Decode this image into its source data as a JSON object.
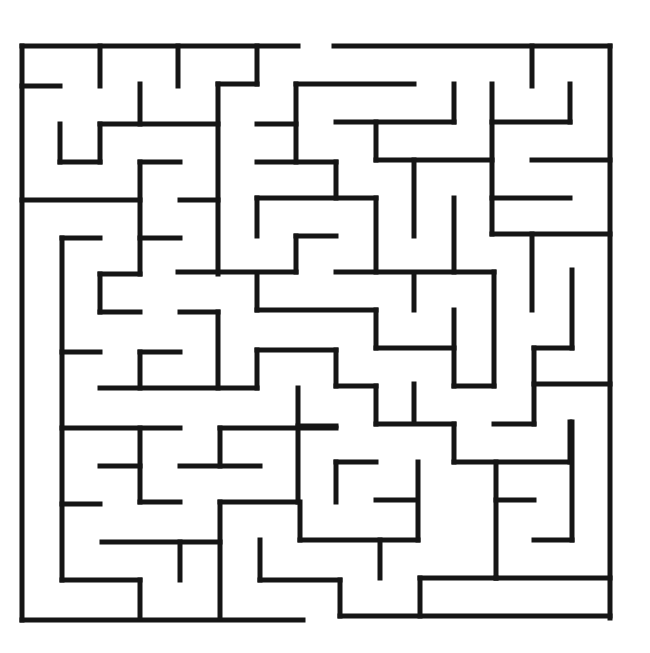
{
  "puzzle": {
    "type": "maze",
    "caption_fragment": "",
    "wall_color": "#151515",
    "background": "#ffffff",
    "entrance": {
      "side": "top",
      "x_range": [
        298,
        334
      ],
      "y": 46
    },
    "exit": {
      "side": "bottom",
      "x_range": [
        303,
        340
      ],
      "y": 618
    },
    "walls": [
      [
        22,
        46,
        298,
        46
      ],
      [
        334,
        46,
        610,
        46
      ],
      [
        610,
        46,
        610,
        618
      ],
      [
        22,
        46,
        22,
        620
      ],
      [
        22,
        620,
        303,
        620
      ],
      [
        340,
        616,
        610,
        616
      ],
      [
        22,
        86,
        60,
        86
      ],
      [
        100,
        46,
        100,
        86
      ],
      [
        178,
        46,
        178,
        86
      ],
      [
        257,
        46,
        257,
        84
      ],
      [
        218,
        84,
        257,
        84
      ],
      [
        218,
        84,
        218,
        274
      ],
      [
        140,
        84,
        140,
        124
      ],
      [
        100,
        124,
        218,
        124
      ],
      [
        100,
        124,
        100,
        162
      ],
      [
        60,
        124,
        60,
        162
      ],
      [
        60,
        162,
        100,
        162
      ],
      [
        140,
        162,
        180,
        162
      ],
      [
        140,
        162,
        140,
        274
      ],
      [
        22,
        200,
        140,
        200
      ],
      [
        180,
        200,
        218,
        200
      ],
      [
        296,
        84,
        414,
        84
      ],
      [
        296,
        84,
        296,
        162
      ],
      [
        257,
        124,
        296,
        124
      ],
      [
        257,
        162,
        336,
        162
      ],
      [
        336,
        162,
        336,
        198
      ],
      [
        336,
        122,
        454,
        122
      ],
      [
        454,
        84,
        454,
        122
      ],
      [
        376,
        122,
        376,
        160
      ],
      [
        376,
        160,
        492,
        160
      ],
      [
        492,
        84,
        492,
        234
      ],
      [
        532,
        46,
        532,
        86
      ],
      [
        570,
        84,
        570,
        122
      ],
      [
        492,
        122,
        570,
        122
      ],
      [
        532,
        160,
        610,
        160
      ],
      [
        492,
        198,
        570,
        198
      ],
      [
        492,
        234,
        610,
        234
      ],
      [
        257,
        198,
        376,
        198
      ],
      [
        257,
        198,
        257,
        236
      ],
      [
        376,
        198,
        376,
        272
      ],
      [
        414,
        160,
        414,
        236
      ],
      [
        454,
        198,
        454,
        272
      ],
      [
        62,
        238,
        100,
        238
      ],
      [
        62,
        238,
        62,
        580
      ],
      [
        140,
        238,
        180,
        238
      ],
      [
        296,
        236,
        336,
        236
      ],
      [
        296,
        236,
        296,
        272
      ],
      [
        178,
        272,
        296,
        272
      ],
      [
        336,
        272,
        494,
        272
      ],
      [
        494,
        272,
        494,
        386
      ],
      [
        532,
        234,
        532,
        310
      ],
      [
        572,
        270,
        572,
        348
      ],
      [
        100,
        274,
        140,
        274
      ],
      [
        100,
        274,
        100,
        312
      ],
      [
        100,
        312,
        140,
        312
      ],
      [
        180,
        312,
        218,
        312
      ],
      [
        218,
        312,
        218,
        388
      ],
      [
        257,
        274,
        257,
        310
      ],
      [
        257,
        310,
        376,
        310
      ],
      [
        376,
        310,
        376,
        348
      ],
      [
        376,
        348,
        454,
        348
      ],
      [
        454,
        310,
        454,
        386
      ],
      [
        454,
        386,
        494,
        386
      ],
      [
        414,
        274,
        414,
        310
      ],
      [
        534,
        348,
        572,
        348
      ],
      [
        534,
        348,
        534,
        424
      ],
      [
        534,
        384,
        610,
        384
      ],
      [
        494,
        424,
        534,
        424
      ],
      [
        62,
        352,
        100,
        352
      ],
      [
        140,
        352,
        180,
        352
      ],
      [
        140,
        352,
        140,
        388
      ],
      [
        100,
        388,
        257,
        388
      ],
      [
        257,
        350,
        257,
        388
      ],
      [
        257,
        350,
        336,
        350
      ],
      [
        336,
        350,
        336,
        386
      ],
      [
        336,
        386,
        376,
        386
      ],
      [
        376,
        386,
        376,
        424
      ],
      [
        298,
        388,
        298,
        502
      ],
      [
        414,
        384,
        414,
        422
      ],
      [
        62,
        428,
        180,
        428
      ],
      [
        140,
        428,
        140,
        502
      ],
      [
        100,
        466,
        140,
        466
      ],
      [
        140,
        502,
        180,
        502
      ],
      [
        220,
        428,
        336,
        428
      ],
      [
        220,
        428,
        220,
        466
      ],
      [
        180,
        466,
        260,
        466
      ],
      [
        298,
        426,
        336,
        426
      ],
      [
        376,
        424,
        454,
        424
      ],
      [
        454,
        424,
        454,
        462
      ],
      [
        454,
        462,
        570,
        462
      ],
      [
        570,
        422,
        570,
        462
      ],
      [
        336,
        462,
        376,
        462
      ],
      [
        336,
        462,
        336,
        502
      ],
      [
        418,
        462,
        418,
        540
      ],
      [
        376,
        500,
        414,
        500
      ],
      [
        300,
        540,
        418,
        540
      ],
      [
        300,
        502,
        300,
        540
      ],
      [
        62,
        504,
        100,
        504
      ],
      [
        220,
        502,
        298,
        502
      ],
      [
        220,
        502,
        220,
        618
      ],
      [
        102,
        542,
        220,
        542
      ],
      [
        180,
        542,
        180,
        580
      ],
      [
        62,
        580,
        140,
        580
      ],
      [
        140,
        580,
        140,
        618
      ],
      [
        260,
        540,
        260,
        580
      ],
      [
        260,
        580,
        340,
        580
      ],
      [
        340,
        580,
        340,
        616
      ],
      [
        380,
        540,
        380,
        578
      ],
      [
        420,
        578,
        496,
        578
      ],
      [
        420,
        578,
        420,
        616
      ],
      [
        496,
        462,
        496,
        578
      ],
      [
        496,
        500,
        534,
        500
      ],
      [
        534,
        540,
        572,
        540
      ],
      [
        572,
        422,
        572,
        540
      ],
      [
        496,
        578,
        610,
        578
      ]
    ]
  }
}
